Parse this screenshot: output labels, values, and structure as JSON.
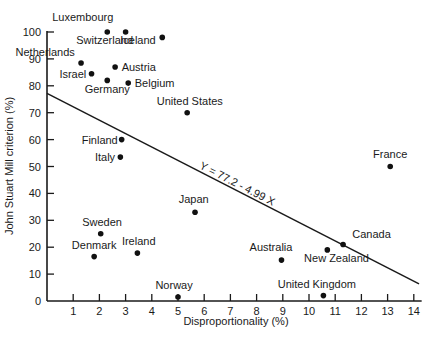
{
  "chart_data": {
    "type": "scatter",
    "title": "",
    "xlabel": "Disproportionality (%)",
    "ylabel": "John Stuart Mill criterion (%)",
    "xlim": [
      0,
      14.3
    ],
    "ylim": [
      0,
      100
    ],
    "xticks": [
      1,
      2,
      3,
      4,
      5,
      6,
      7,
      8,
      9,
      10,
      11,
      12,
      13,
      14
    ],
    "yticks": [
      0,
      10,
      20,
      30,
      40,
      50,
      60,
      70,
      80,
      90,
      100
    ],
    "grid": false,
    "legend": null,
    "points": [
      {
        "label": "Luxembourg",
        "x": 3.0,
        "y": 100,
        "lx": 0.2,
        "ly": 104,
        "anchor": "start"
      },
      {
        "label": "Switzerland",
        "x": 2.3,
        "y": 100,
        "lx": 2.2,
        "ly": 95.5,
        "anchor": "middle"
      },
      {
        "label": "Iceland",
        "x": 4.4,
        "y": 98,
        "lx": 4.15,
        "ly": 95.5,
        "anchor": "end"
      },
      {
        "label": "Netherlands",
        "x": 1.3,
        "y": 88.5,
        "lx": -1.2,
        "ly": 91,
        "anchor": "start"
      },
      {
        "label": "Austria",
        "x": 2.6,
        "y": 87,
        "lx": 2.85,
        "ly": 85.5,
        "anchor": "start"
      },
      {
        "label": "Israel",
        "x": 1.7,
        "y": 84.5,
        "lx": 1.5,
        "ly": 83,
        "anchor": "end"
      },
      {
        "label": "Germany",
        "x": 2.3,
        "y": 82,
        "lx": 2.3,
        "ly": 77.5,
        "anchor": "middle"
      },
      {
        "label": "Belgium",
        "x": 3.1,
        "y": 81,
        "lx": 3.35,
        "ly": 79.5,
        "anchor": "start"
      },
      {
        "label": "United States",
        "x": 5.35,
        "y": 70,
        "lx": 5.45,
        "ly": 73,
        "anchor": "middle"
      },
      {
        "label": "Finland",
        "x": 2.85,
        "y": 60,
        "lx": 2.7,
        "ly": 58.5,
        "anchor": "end"
      },
      {
        "label": "Italy",
        "x": 2.8,
        "y": 53.5,
        "lx": 2.6,
        "ly": 52,
        "anchor": "end"
      },
      {
        "label": "France",
        "x": 13.1,
        "y": 50,
        "lx": 13.1,
        "ly": 53,
        "anchor": "middle"
      },
      {
        "label": "Japan",
        "x": 5.65,
        "y": 33,
        "lx": 5.6,
        "ly": 36.5,
        "anchor": "middle"
      },
      {
        "label": "Sweden",
        "x": 2.05,
        "y": 25,
        "lx": 2.1,
        "ly": 28,
        "anchor": "middle"
      },
      {
        "label": "Denmark",
        "x": 1.8,
        "y": 16.5,
        "lx": 1.8,
        "ly": 19.5,
        "anchor": "middle"
      },
      {
        "label": "Ireland",
        "x": 3.45,
        "y": 17.8,
        "lx": 3.5,
        "ly": 20.8,
        "anchor": "middle"
      },
      {
        "label": "Australia",
        "x": 8.95,
        "y": 15.2,
        "lx": 8.55,
        "ly": 18.5,
        "anchor": "middle"
      },
      {
        "label": "New Zealand",
        "x": 10.7,
        "y": 19,
        "lx": 11.05,
        "ly": 14.5,
        "anchor": "middle"
      },
      {
        "label": "Canada",
        "x": 11.3,
        "y": 21,
        "lx": 11.65,
        "ly": 23.5,
        "anchor": "start"
      },
      {
        "label": "Norway",
        "x": 5.0,
        "y": 1.5,
        "lx": 4.85,
        "ly": 4.5,
        "anchor": "middle"
      },
      {
        "label": "United Kingdom",
        "x": 10.55,
        "y": 2,
        "lx": 10.3,
        "ly": 5,
        "anchor": "middle"
      }
    ],
    "regression": {
      "label": "Y = 77.2 - 4.99 X",
      "intercept": 77.2,
      "slope": -4.99,
      "x_start": 0,
      "x_end": 14.2
    }
  }
}
